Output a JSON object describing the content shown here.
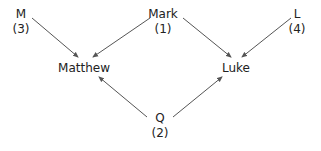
{
  "diagram": {
    "type": "source-dependency graph",
    "nodes": [
      {
        "id": "M",
        "label": "M",
        "sub": "(3)"
      },
      {
        "id": "Mark",
        "label": "Mark",
        "sub": "(1)"
      },
      {
        "id": "L",
        "label": "L",
        "sub": "(4)"
      },
      {
        "id": "Matthew",
        "label": "Matthew",
        "sub": ""
      },
      {
        "id": "Luke",
        "label": "Luke",
        "sub": ""
      },
      {
        "id": "Q",
        "label": "Q",
        "sub": "(2)"
      }
    ],
    "edges": [
      {
        "from": "M",
        "to": "Matthew"
      },
      {
        "from": "Mark",
        "to": "Matthew"
      },
      {
        "from": "Mark",
        "to": "Luke"
      },
      {
        "from": "L",
        "to": "Luke"
      },
      {
        "from": "Q",
        "to": "Matthew"
      },
      {
        "from": "Q",
        "to": "Luke"
      }
    ],
    "colors": {
      "edge": "#555555",
      "text": "#222222",
      "background": "#ffffff"
    }
  }
}
